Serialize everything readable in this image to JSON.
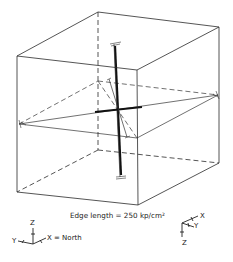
{
  "figure": {
    "caption": "Edge length = 250 kp/cm²",
    "cube": {
      "corners": {
        "top_front_left": [
          17,
          56
        ],
        "top_front_right": [
          137,
          70
        ],
        "top_back_right": [
          219,
          27
        ],
        "top_back_left": [
          98,
          12
        ],
        "bottom_front_left": [
          17,
          192
        ],
        "bottom_front_right": [
          138,
          205
        ],
        "bottom_back_right": [
          219,
          163
        ],
        "bottom_back_left": [
          98,
          150
        ]
      }
    },
    "section_plane": {
      "left": [
        19,
        124
      ],
      "right": [
        218,
        95
      ],
      "back": [
        98,
        81
      ],
      "front": [
        137,
        138
      ]
    },
    "principal_axes": [
      {
        "name": "major",
        "from": [
          115,
          44
        ],
        "to": [
          121,
          177
        ]
      },
      {
        "name": "intermediate",
        "from": [
          95,
          112
        ],
        "to": [
          142,
          107
        ]
      },
      {
        "name": "minor",
        "from": [
          109,
          79
        ],
        "to": [
          127,
          137
        ]
      }
    ],
    "left_triad": {
      "z_label": "Z",
      "y_label": "Y",
      "x_label": "X = North"
    },
    "right_triad": {
      "x_label": "X",
      "y_label": "Y",
      "z_label": "Z"
    }
  }
}
